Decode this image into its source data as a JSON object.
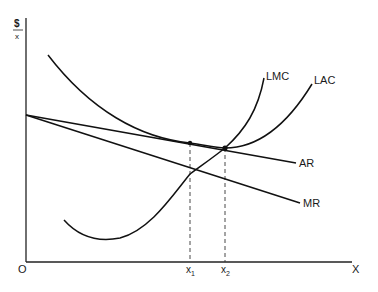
{
  "diagram": {
    "type": "economics-cost-revenue-diagram",
    "y_axis": {
      "label_top": "$",
      "label_bottom": "x"
    },
    "x_axis": {
      "label": "X",
      "origin": "O"
    },
    "curves": [
      {
        "id": "LMC",
        "label": "LMC"
      },
      {
        "id": "LAC",
        "label": "LAC"
      },
      {
        "id": "AR",
        "label": "AR"
      },
      {
        "id": "MR",
        "label": "MR"
      }
    ],
    "x_markers": [
      {
        "id": "x1",
        "base": "x",
        "sub": "1"
      },
      {
        "id": "x2",
        "base": "x",
        "sub": "2"
      }
    ],
    "points": [
      {
        "id": "tangency-LAC-AR",
        "at": "x1"
      },
      {
        "id": "intersection-LMC-LAC",
        "at": "x2"
      }
    ]
  }
}
